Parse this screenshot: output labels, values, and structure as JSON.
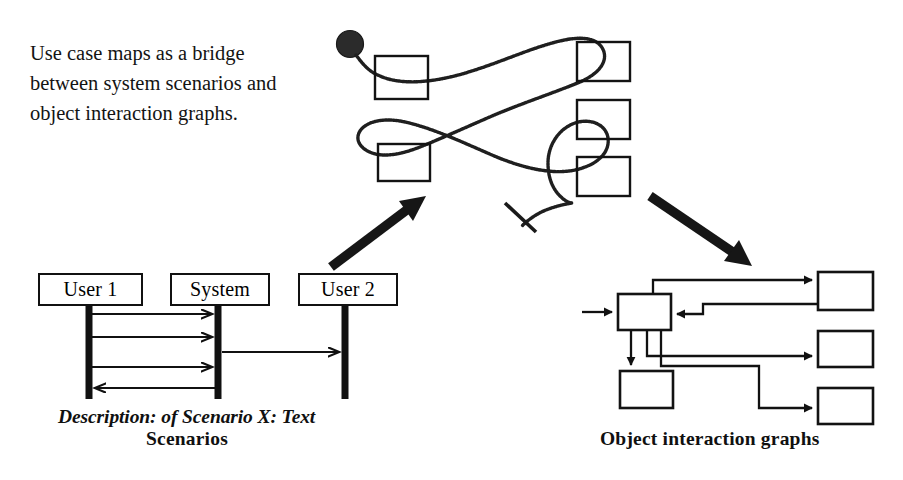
{
  "figure": {
    "caption": "Use case maps as a bridge\nbetween system scenarios and\nobject interaction graphs."
  },
  "scenarios": {
    "section_label": "Scenarios",
    "description_label": "Description: of Scenario X: Text",
    "actors": [
      {
        "name": "User 1",
        "label": "User 1"
      },
      {
        "name": "System",
        "label": "System"
      },
      {
        "name": "User 2",
        "label": "User 2"
      }
    ],
    "messages": [
      {
        "from": "User 1",
        "to": "System",
        "direction": "right"
      },
      {
        "from": "User 1",
        "to": "System",
        "direction": "right"
      },
      {
        "from": "System",
        "to": "User 2",
        "direction": "right"
      },
      {
        "from": "User 1",
        "to": "System",
        "direction": "right"
      },
      {
        "from": "System",
        "to": "User 1",
        "direction": "left"
      }
    ]
  },
  "use_case_map": {
    "start_marker": "filled-circle",
    "end_marker": "perpendicular-bar",
    "responsibility_boxes": 5
  },
  "object_graph": {
    "section_label": "Object interaction graphs",
    "boxes": 5
  },
  "bridge_arrows": {
    "left_arrow": "scenarios-to-use-case-map",
    "right_arrow": "use-case-map-to-object-graphs"
  },
  "colors": {
    "ink": "#111111",
    "paper": "#ffffff"
  }
}
